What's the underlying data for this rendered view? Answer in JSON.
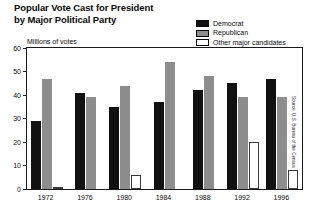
{
  "title": {
    "line1": "Popular Vote Cast for President",
    "line2": "by Major Political Party"
  },
  "legend": {
    "position": "top-right",
    "items": [
      {
        "label": "Democrat",
        "color": "#111111",
        "swatch": "filled-black"
      },
      {
        "label": "Republican",
        "color": "#8d8d8d",
        "swatch": "filled-gray"
      },
      {
        "label": "Other major candidates",
        "color": "#ffffff",
        "swatch": "outline-white"
      }
    ]
  },
  "axis": {
    "y_label": "Millions of votes",
    "y_ticks": [
      "0",
      "10",
      "20",
      "30",
      "40",
      "50",
      "60"
    ]
  },
  "source": "Source: U.S. Bureau of the Census",
  "chart_data": {
    "type": "bar",
    "title": "Popular Vote Cast for President by Major Political Party",
    "xlabel": "",
    "ylabel": "Millions of votes",
    "ylim": [
      0,
      60
    ],
    "ytick_step": 10,
    "grid": false,
    "legend_position": "top-right",
    "categories": [
      "1972",
      "1976",
      "1980",
      "1984",
      "1988",
      "1992",
      "1996"
    ],
    "series": [
      {
        "name": "Democrat",
        "color": "#111111",
        "values": [
          29,
          41,
          35,
          37,
          42,
          45,
          47
        ]
      },
      {
        "name": "Republican",
        "color": "#8d8d8d",
        "values": [
          47,
          39,
          44,
          54,
          48,
          39,
          39
        ]
      },
      {
        "name": "Other major candidates",
        "color": "#ffffff",
        "values": [
          1,
          0,
          6,
          0,
          0,
          20,
          8
        ]
      }
    ]
  }
}
